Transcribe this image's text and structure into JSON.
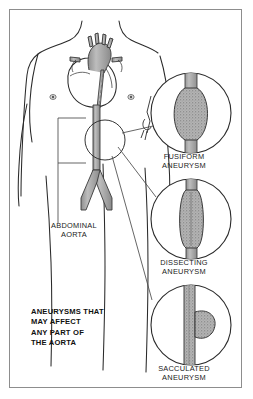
{
  "figure": {
    "title": "Aneurysms that may affect any part of the aorta",
    "background_color": "#ffffff",
    "border_color": "#8d8d8d",
    "ink_color": "#1b1b1b",
    "vessel_fill_color": "#a9a9a9"
  },
  "caption": {
    "text": "ANEURYSMS THAT\nMAY AFFECT\nANY PART OF\nTHE AORTA",
    "style": "bold-uppercase"
  },
  "anatomy": {
    "abdominal_aorta_label": "ABDOMINAL\nAORTA",
    "structures": [
      "torso-outline",
      "heart",
      "aortic-arch",
      "thoracic-aorta",
      "abdominal-aorta",
      "iliac-arteries"
    ]
  },
  "detail_circles": [
    {
      "id": "fusiform",
      "label": "FUSIFORM\nANEURYSM",
      "description": "Spindle-shaped symmetrical dilation of the vessel",
      "shape": "fusiform-bulge"
    },
    {
      "id": "dissecting",
      "label": "DISSECTING\nANEURYSM",
      "description": "Elongated widened vessel segment with split wall",
      "shape": "dissecting-widening"
    },
    {
      "id": "sacculated",
      "label": "SACCULATED\nANEURYSM",
      "description": "Round sac bulging from one side of the vessel",
      "shape": "saccular-outpouching"
    }
  ]
}
